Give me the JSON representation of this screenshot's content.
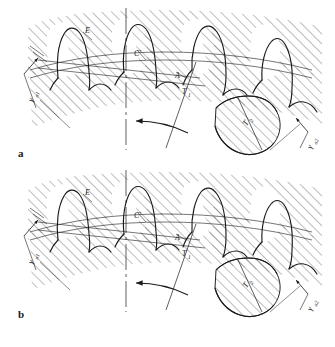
{
  "figure": {
    "background_color": "#ffffff",
    "line_color": "#1a1a1a",
    "hatch_color": "#555555",
    "width": 335,
    "height": 347
  },
  "panels": [
    {
      "id": "a",
      "letter": "a",
      "letter_x": 18,
      "letter_y": 157,
      "origin_y": 0,
      "labels": {
        "point_e": "E",
        "point_c_prime": "C'",
        "point_a": "A",
        "point_t1": "T",
        "point_t1_sub": "1",
        "point_t2": "T",
        "point_t2_sub": "2",
        "dim_left": "γ",
        "dim_left_sub": "a1",
        "dim_right": "γ",
        "dim_right_sub": "a2"
      }
    },
    {
      "id": "b",
      "letter": "b",
      "letter_x": 18,
      "letter_y": 318,
      "origin_y": 162,
      "labels": {
        "point_e": "E",
        "point_c_prime": "C'",
        "point_a": "A",
        "point_t1": "T",
        "point_t1_sub": "1",
        "point_t2": "T",
        "point_t2_sub": "2",
        "dim_left": "γ",
        "dim_left_sub": "a1",
        "dim_right": "γ",
        "dim_right_sub": "a2"
      }
    }
  ],
  "annotations": {
    "rotation_arrow_name": "rotation-direction-arrow",
    "centerline_name": "vertical-centerline",
    "pitchline_name": "pitch-line"
  }
}
